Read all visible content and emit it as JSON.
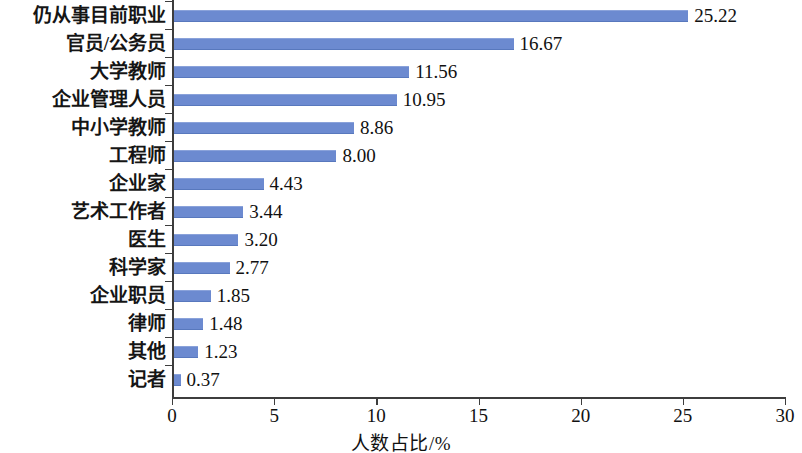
{
  "chart_data": {
    "type": "bar",
    "orientation": "horizontal",
    "title": "",
    "xlabel": "人数占比/%",
    "ylabel": "",
    "xlim": [
      0,
      30
    ],
    "xticks": [
      0,
      5,
      10,
      15,
      20,
      25,
      30
    ],
    "xticklabels": [
      "0",
      "5",
      "10",
      "15",
      "20",
      "25",
      "30"
    ],
    "grid": false,
    "legend": null,
    "bar_color": "#6c8ad0",
    "categories": [
      "仍从事目前职业",
      "官员/公务员",
      "大学教师",
      "企业管理人员",
      "中小学教师",
      "工程师",
      "企业家",
      "艺术工作者",
      "医生",
      "科学家",
      "企业职员",
      "律师",
      "其他",
      "记者"
    ],
    "values": [
      25.22,
      16.67,
      11.56,
      10.95,
      8.86,
      8.0,
      4.43,
      3.44,
      3.2,
      2.77,
      1.85,
      1.48,
      1.23,
      0.37
    ],
    "value_labels": [
      "25.22",
      "16.67",
      "11.56",
      "10.95",
      "8.86",
      "8.00",
      "4.43",
      "3.44",
      "3.20",
      "2.77",
      "1.85",
      "1.48",
      "1.23",
      "0.37"
    ]
  }
}
